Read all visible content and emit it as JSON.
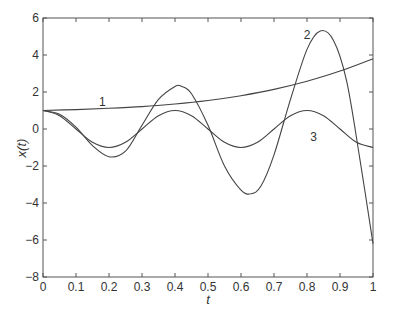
{
  "chart_data": {
    "type": "line",
    "title": "",
    "xlabel": "t",
    "ylabel": "x(t)",
    "xlim": [
      0,
      1
    ],
    "ylim": [
      -8,
      6
    ],
    "grid": false,
    "legend": null,
    "xticks": [
      0,
      0.1,
      0.2,
      0.3,
      0.4,
      0.5,
      0.6,
      0.7,
      0.8,
      0.9,
      1
    ],
    "xtick_labels": [
      "0",
      "0.1",
      "0.2",
      "0.3",
      "0.4",
      "0.5",
      "0.6",
      "0.7",
      "0.8",
      "0.9",
      "1"
    ],
    "yticks": [
      -8,
      -6,
      -4,
      -2,
      0,
      2,
      4,
      6
    ],
    "ytick_labels": [
      "−8",
      "−6",
      "−4",
      "−2",
      "0",
      "2",
      "4",
      "6"
    ],
    "series": [
      {
        "name": "1",
        "label_pos": [
          0.18,
          1.45
        ],
        "x": [
          0,
          0.1,
          0.2,
          0.3,
          0.4,
          0.5,
          0.6,
          0.7,
          0.8,
          0.9,
          1.0
        ],
        "y": [
          1.0,
          1.05,
          1.12,
          1.21,
          1.35,
          1.54,
          1.8,
          2.14,
          2.58,
          3.13,
          3.8
        ]
      },
      {
        "name": "2",
        "label_pos": [
          0.8,
          5.1
        ],
        "x": [
          0,
          0.05,
          0.1,
          0.15,
          0.2,
          0.25,
          0.3,
          0.35,
          0.4,
          0.42,
          0.45,
          0.5,
          0.55,
          0.6,
          0.63,
          0.66,
          0.7,
          0.75,
          0.8,
          0.84,
          0.88,
          0.92,
          0.96,
          1.0
        ],
        "y": [
          1.0,
          0.8,
          0.1,
          -0.9,
          -1.5,
          -1.2,
          0.2,
          1.6,
          2.3,
          2.3,
          1.9,
          0.2,
          -2.0,
          -3.3,
          -3.5,
          -3.1,
          -1.4,
          1.6,
          4.3,
          5.3,
          4.8,
          2.6,
          -1.6,
          -6.2
        ]
      },
      {
        "name": "3",
        "label_pos": [
          0.82,
          -0.45
        ],
        "x": [
          0,
          0.05,
          0.1,
          0.15,
          0.2,
          0.25,
          0.3,
          0.35,
          0.4,
          0.45,
          0.5,
          0.55,
          0.6,
          0.65,
          0.7,
          0.75,
          0.8,
          0.85,
          0.9,
          0.95,
          1.0
        ],
        "y": [
          1.0,
          0.72,
          0.0,
          -0.72,
          -1.0,
          -0.72,
          0.0,
          0.72,
          1.0,
          0.72,
          0.0,
          -0.72,
          -1.0,
          -0.72,
          0.0,
          0.72,
          1.0,
          0.72,
          0.0,
          -0.72,
          -1.0
        ]
      }
    ]
  }
}
